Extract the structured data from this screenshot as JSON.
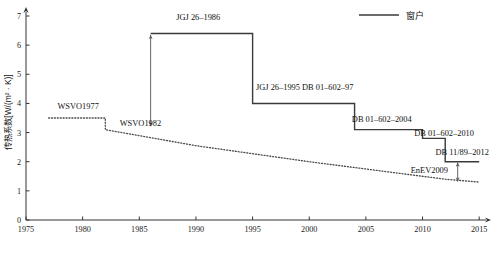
{
  "chart_data": {
    "type": "line",
    "title": "",
    "xlabel": "",
    "ylabel": "传热系数[W/(m² · K)]",
    "xlim": [
      1975,
      2015.6
    ],
    "ylim": [
      0,
      7
    ],
    "grid": false,
    "legend_position": "top-right",
    "x_ticks": [
      "1975",
      "1980",
      "1985",
      "1990",
      "1995",
      "2000",
      "2005",
      "2010",
      "2015"
    ],
    "x_tick_values": [
      1975,
      1980,
      1985,
      1990,
      1995,
      2000,
      2005,
      2010,
      2015
    ],
    "y_ticks": [
      "0",
      "1",
      "2",
      "3",
      "4",
      "5",
      "6",
      "7"
    ],
    "y_tick_values": [
      0,
      1,
      2,
      3,
      4,
      5,
      6,
      7
    ],
    "legend": [
      {
        "label": "窗户",
        "style": "solid"
      }
    ],
    "series": [
      {
        "name": "窗户",
        "style": "step-solid",
        "points": [
          {
            "x": 1986,
            "y": 6.4
          },
          {
            "x": 1995,
            "y": 6.4
          },
          {
            "x": 1995,
            "y": 4.0
          },
          {
            "x": 2004,
            "y": 4.0
          },
          {
            "x": 2004,
            "y": 3.1
          },
          {
            "x": 2010,
            "y": 3.1
          },
          {
            "x": 2010,
            "y": 2.8
          },
          {
            "x": 2012,
            "y": 2.8
          },
          {
            "x": 2012,
            "y": 2.0
          },
          {
            "x": 2015,
            "y": 2.0
          }
        ]
      },
      {
        "name": "德国标准",
        "style": "dotted",
        "points": [
          {
            "x": 1977,
            "y": 3.5
          },
          {
            "x": 1982,
            "y": 3.5
          },
          {
            "x": 1982,
            "y": 3.1
          },
          {
            "x": 1990,
            "y": 2.55
          },
          {
            "x": 2000,
            "y": 2.0
          },
          {
            "x": 2009,
            "y": 1.55
          },
          {
            "x": 2012,
            "y": 1.4
          },
          {
            "x": 2015,
            "y": 1.3
          }
        ]
      }
    ],
    "annotations": [
      {
        "id": "jgj-26-1986",
        "text": "JGJ 26–1986",
        "x": 1990.2,
        "y": 6.85
      },
      {
        "id": "jgj-26-1995-db-01-602-97",
        "text": "JGJ 26–1995  DB 01–602–97",
        "x": 1999.6,
        "y": 4.45
      },
      {
        "id": "db-01-602-2004",
        "text": "DB 01–602–2004",
        "x": 2006.4,
        "y": 3.35
      },
      {
        "id": "db-01-602-2010",
        "text": "DB 01–602–2010",
        "x": 2011.9,
        "y": 2.88
      },
      {
        "id": "db-11-89-2012",
        "text": "DB 11/89–2012",
        "x": 2013.5,
        "y": 2.22
      },
      {
        "id": "wsvo1977",
        "text": "WSVO1977",
        "x": 1979.6,
        "y": 3.82
      },
      {
        "id": "wsvo1982",
        "text": "WSVO1982",
        "x": 1985.1,
        "y": 3.24
      },
      {
        "id": "enev2009",
        "text": "EnEV2009",
        "x": 2010.6,
        "y": 1.62
      }
    ],
    "gap_arrows": [
      {
        "id": "gap-arrow-1986",
        "x": 1986,
        "y_top": 6.35,
        "y_bottom": 3.22
      },
      {
        "id": "gap-arrow-2012",
        "x": 2013.1,
        "y_top": 1.97,
        "y_bottom": 1.32
      }
    ]
  },
  "caption": {
    "text": ""
  }
}
